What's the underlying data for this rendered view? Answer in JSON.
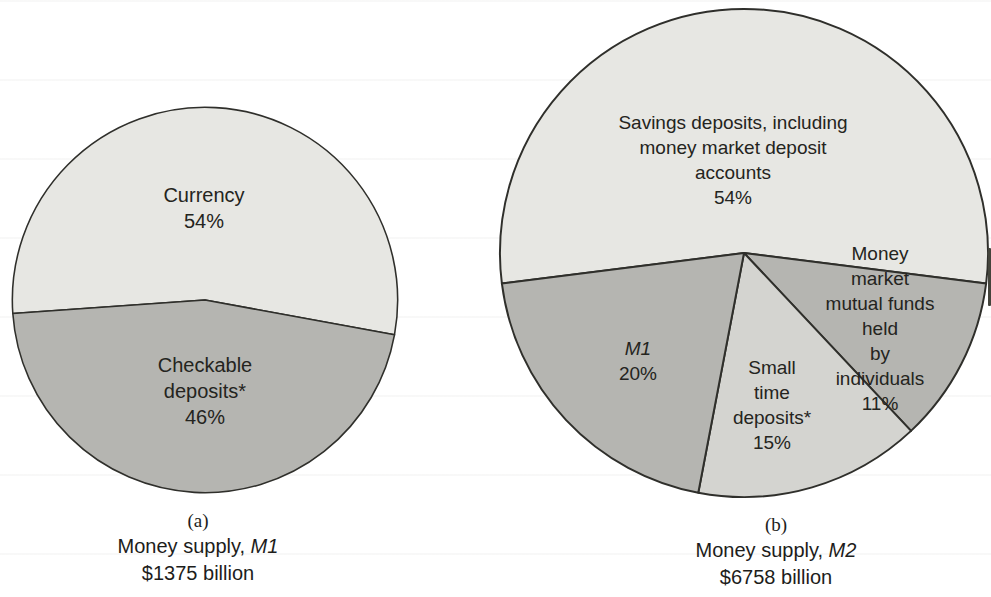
{
  "figure": {
    "description_a": "(a)",
    "description_b": "(b)"
  },
  "colors": {
    "outline": "#2f2f2b",
    "light_slice": "#e7e7e3",
    "medium_slice": "#b5b5b1",
    "small_time_slice": "#d4d4d0"
  },
  "chart_data": [
    {
      "type": "pie",
      "part_label": "(a)",
      "title_prefix": "Money supply, ",
      "title_m": "M1",
      "title": "Money supply, M1",
      "total": "$1375 billion",
      "legend_position": "none",
      "start_angle_deg": 176,
      "slices": [
        {
          "name": "currency",
          "pct": 54,
          "label": "Currency",
          "pct_label": "54%",
          "color": "#e7e7e3"
        },
        {
          "name": "checkable-deposits",
          "pct": 46,
          "label": "Checkable\ndeposits*",
          "pct_label": "46%",
          "color": "#b5b5b1"
        }
      ]
    },
    {
      "type": "pie",
      "part_label": "(b)",
      "title_prefix": "Money supply, ",
      "title_m": "M2",
      "title": "Money supply, M2",
      "total": "$6758 billion",
      "legend_position": "none",
      "start_angle_deg": 172.8,
      "slices": [
        {
          "name": "savings-deposits",
          "pct": 54,
          "label": "Savings deposits, including\nmoney market deposit accounts",
          "pct_label": "54%",
          "color": "#e7e7e3"
        },
        {
          "name": "money-market-mutual-funds",
          "pct": 11,
          "label": "Money market\nmutual funds held\nby individuals",
          "pct_label": "11%",
          "color": "#b5b5b1"
        },
        {
          "name": "small-time-deposits",
          "pct": 15,
          "label": "Small\ntime\ndeposits*",
          "pct_label": "15%",
          "color": "#d4d4d0"
        },
        {
          "name": "m1",
          "pct": 20,
          "label": "M1",
          "pct_label": "20%",
          "color": "#b5b5b1"
        }
      ]
    }
  ]
}
